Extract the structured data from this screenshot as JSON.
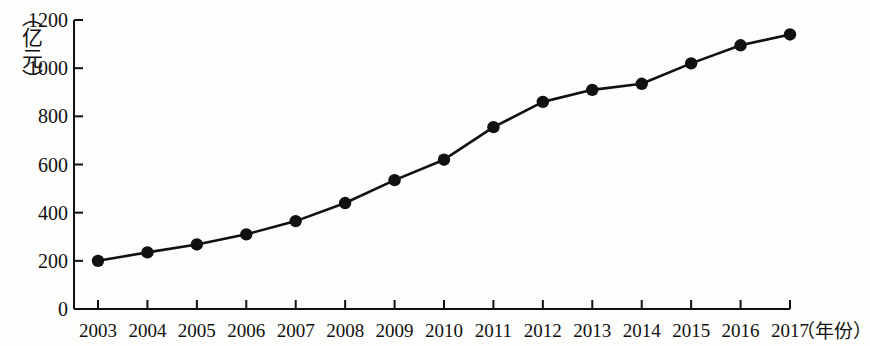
{
  "chart_data": {
    "type": "line",
    "title": "",
    "subtitle": "",
    "xlabel": "（年份）",
    "ylabel": "（亿元）",
    "categories": [
      "2003",
      "2004",
      "2005",
      "2006",
      "2007",
      "2008",
      "2009",
      "2010",
      "2011",
      "2012",
      "2013",
      "2014",
      "2015",
      "2016",
      "2017"
    ],
    "values": [
      200,
      235,
      268,
      310,
      365,
      440,
      535,
      620,
      755,
      860,
      910,
      935,
      1020,
      1095,
      1140
    ],
    "series": [
      {
        "name": "",
        "values": [
          200,
          235,
          268,
          310,
          365,
          440,
          535,
          620,
          755,
          860,
          910,
          935,
          1020,
          1095,
          1140
        ]
      }
    ],
    "x_tick_labels": [
      "2003",
      "2004",
      "2005",
      "2006",
      "2007",
      "2008",
      "2009",
      "2010",
      "2011",
      "2012",
      "2013",
      "2014",
      "2015",
      "2016",
      "2017"
    ],
    "y_tick_labels": [
      "0",
      "200",
      "400",
      "600",
      "800",
      "1000",
      "1200"
    ],
    "y_ticks": [
      0,
      200,
      400,
      600,
      800,
      1000,
      1200
    ],
    "ylim": [
      0,
      1200
    ],
    "grid": false,
    "legend": false,
    "legend_position": "none",
    "marker": "filled-circle",
    "line_color": "#111111",
    "marker_color": "#111111",
    "background_color": "#fdfdfc"
  },
  "axes": {
    "y_unit": "（亿元）",
    "x_unit": "（年份）"
  }
}
